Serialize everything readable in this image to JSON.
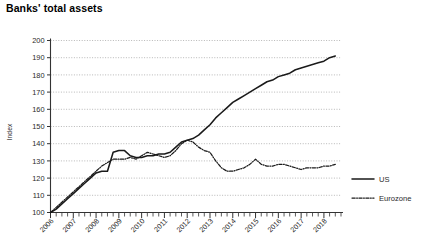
{
  "page": {
    "title": "Banks' total assets"
  },
  "chart_data": {
    "type": "line",
    "title": "Banks' total assets",
    "xlabel": "",
    "ylabel": "Index",
    "ylim": [
      100,
      200
    ],
    "yticks": [
      100,
      110,
      120,
      130,
      140,
      150,
      160,
      170,
      180,
      190,
      200
    ],
    "xlim": [
      2006,
      2018.75
    ],
    "xticks": [
      2006,
      2007,
      2008,
      2009,
      2010,
      2011,
      2012,
      2013,
      2014,
      2015,
      2016,
      2017,
      2018
    ],
    "xtick_labels": [
      "2006",
      "2007",
      "2008",
      "2009",
      "2010",
      "2011",
      "2012",
      "2013",
      "2014",
      "2015",
      "2016",
      "2017",
      "2018"
    ],
    "minor_tick_interval": 0.25,
    "grid": true,
    "grid_style": "dotted-horizontal",
    "legend_position": "right",
    "series": [
      {
        "name": "US",
        "style": "solid",
        "color": "#1a1a1a",
        "x": [
          2006.0,
          2006.25,
          2006.5,
          2006.75,
          2007.0,
          2007.25,
          2007.5,
          2007.75,
          2008.0,
          2008.25,
          2008.5,
          2008.75,
          2009.0,
          2009.25,
          2009.5,
          2009.75,
          2010.0,
          2010.25,
          2010.5,
          2010.75,
          2011.0,
          2011.25,
          2011.5,
          2011.75,
          2012.0,
          2012.25,
          2012.5,
          2012.75,
          2013.0,
          2013.25,
          2013.5,
          2013.75,
          2014.0,
          2014.25,
          2014.5,
          2014.75,
          2015.0,
          2015.25,
          2015.5,
          2015.75,
          2016.0,
          2016.25,
          2016.5,
          2016.75,
          2017.0,
          2017.25,
          2017.5,
          2017.75,
          2018.0,
          2018.25,
          2018.5
        ],
        "values": [
          100,
          102,
          105,
          108,
          111,
          114,
          117,
          120,
          123,
          124,
          124,
          135,
          136,
          136,
          133,
          132,
          132,
          133,
          133,
          134,
          134,
          135,
          138,
          141,
          142,
          143,
          145,
          148,
          151,
          155,
          158,
          161,
          164,
          166,
          168,
          170,
          172,
          174,
          176,
          177,
          179,
          180,
          181,
          183,
          184,
          185,
          186,
          187,
          188,
          190,
          191
        ]
      },
      {
        "name": "Eurozone",
        "style": "dash-dot",
        "color": "#1a1a1a",
        "x": [
          2006.0,
          2006.25,
          2006.5,
          2006.75,
          2007.0,
          2007.25,
          2007.5,
          2007.75,
          2008.0,
          2008.25,
          2008.5,
          2008.75,
          2009.0,
          2009.25,
          2009.5,
          2009.75,
          2010.0,
          2010.25,
          2010.5,
          2010.75,
          2011.0,
          2011.25,
          2011.5,
          2011.75,
          2012.0,
          2012.25,
          2012.5,
          2012.75,
          2013.0,
          2013.25,
          2013.5,
          2013.75,
          2014.0,
          2014.25,
          2014.5,
          2014.75,
          2015.0,
          2015.25,
          2015.5,
          2015.75,
          2016.0,
          2016.25,
          2016.5,
          2016.75,
          2017.0,
          2017.25,
          2017.5,
          2017.75,
          2018.0,
          2018.25,
          2018.5
        ],
        "values": [
          100,
          103,
          106,
          109,
          112,
          115,
          118,
          121,
          124,
          127,
          129,
          131,
          131,
          131,
          132,
          131,
          133,
          135,
          134,
          133,
          132,
          133,
          136,
          140,
          142,
          141,
          138,
          136,
          135,
          130,
          126,
          124,
          124,
          125,
          126,
          128,
          131,
          128,
          127,
          127,
          128,
          128,
          127,
          126,
          125,
          126,
          126,
          126,
          127,
          127,
          128
        ]
      }
    ]
  },
  "legend": {
    "items": [
      {
        "label": "US",
        "style": "solid"
      },
      {
        "label": "Eurozone",
        "style": "dash-dot"
      }
    ]
  }
}
